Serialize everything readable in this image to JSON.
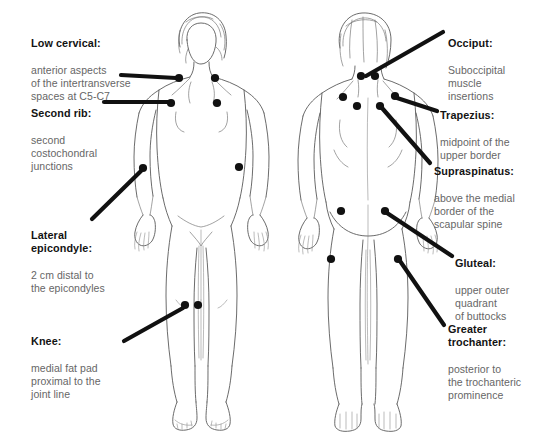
{
  "diagram": {
    "figures": [
      {
        "name": "anterior-figure",
        "view": "anterior"
      },
      {
        "name": "posterior-figure",
        "view": "posterior"
      }
    ],
    "ink_color": "#1a1a1a",
    "outline_color": "#555555",
    "heading_color": "#131313",
    "body_color": "#666666",
    "background": "#ffffff"
  },
  "callouts": {
    "low_cervical": {
      "title": "Low cervical:",
      "body": "anterior aspects\nof the intertransverse\nspaces at C5-C7"
    },
    "second_rib": {
      "title": "Second rib:",
      "body": "second\ncostochondral\njunctions"
    },
    "lateral_epicondyle": {
      "title": "Lateral\nepicondyle:",
      "body": "2 cm distal to\nthe epicondyles"
    },
    "knee": {
      "title": "Knee:",
      "body": "medial fat pad\nproximal to the\njoint line"
    },
    "occiput": {
      "title": "Occiput:",
      "body": "Suboccipital\nmuscle\ninsertions"
    },
    "trapezius": {
      "title": "Trapezius:",
      "body": "midpoint of the\nupper border"
    },
    "supraspinatus": {
      "title": "Supraspinatus:",
      "body": "above the medial\nborder of the\nscapular spine"
    },
    "gluteal": {
      "title": "Gluteal:",
      "body": "upper outer\nquadrant\nof buttocks"
    },
    "greater_trochanter": {
      "title": "Greater\ntrochanter:",
      "body": "posterior to\nthe trochanteric\nprominence"
    }
  },
  "tender_points": {
    "low_cervical": [
      [
        179,
        78
      ],
      [
        215,
        78
      ]
    ],
    "second_rib": [
      [
        171,
        103
      ],
      [
        217,
        103
      ]
    ],
    "lateral_epicondyle": [
      [
        143,
        168
      ],
      [
        239,
        167
      ]
    ],
    "knee": [
      [
        185,
        305
      ],
      [
        198,
        305
      ]
    ],
    "occiput": [
      [
        361,
        76
      ],
      [
        375,
        76
      ]
    ],
    "trapezius": [
      [
        343,
        97
      ],
      [
        395,
        96
      ]
    ],
    "supraspinatus": [
      [
        357,
        106
      ],
      [
        380,
        106
      ]
    ],
    "gluteal": [
      [
        341,
        211
      ],
      [
        385,
        211
      ]
    ],
    "greater_trochanter": [
      [
        331,
        259
      ],
      [
        398,
        259
      ]
    ]
  }
}
